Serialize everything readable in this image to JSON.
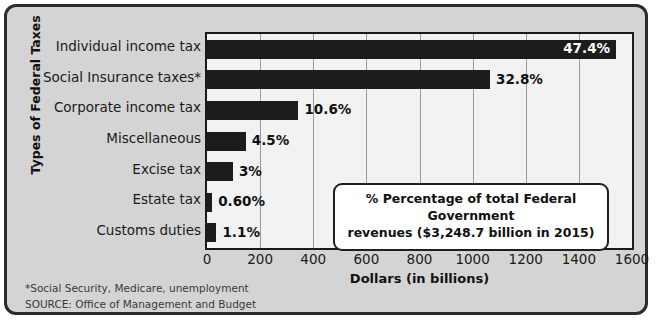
{
  "chart_data": {
    "type": "bar",
    "orientation": "horizontal",
    "title": "",
    "xlabel": "Dollars (in billions)",
    "ylabel": "Types of Federal Taxes",
    "xlim": [
      0,
      1600
    ],
    "xticks": [
      0,
      200,
      400,
      600,
      800,
      1000,
      1200,
      1400,
      1600
    ],
    "grid": true,
    "legend": "none",
    "categories": [
      "Individual income tax",
      "Social Insurance taxes*",
      "Corporate income tax",
      "Miscellaneous",
      "Excise tax",
      "Estate tax",
      "Customs duties"
    ],
    "values": [
      1540.0,
      1065.6,
      344.4,
      146.2,
      97.5,
      19.5,
      35.7
    ],
    "data_labels": [
      "47.4%",
      "32.8%",
      "10.6%",
      "4.5%",
      "3%",
      "0.60%",
      "1.1%"
    ],
    "label_inside": [
      true,
      false,
      false,
      false,
      false,
      false,
      false
    ],
    "bar_color": "#1c1c1c",
    "plot_bg": "#f2f2f2",
    "figure_bg": "#d4d4d4"
  },
  "callout": {
    "line1": "% Percentage of total Federal Government",
    "line2": "revenues ($3,248.7 billion in 2015)"
  },
  "footnotes": {
    "note": "*Social Security, Medicare, unemployment",
    "source": "SOURCE: Office of Management and Budget"
  }
}
